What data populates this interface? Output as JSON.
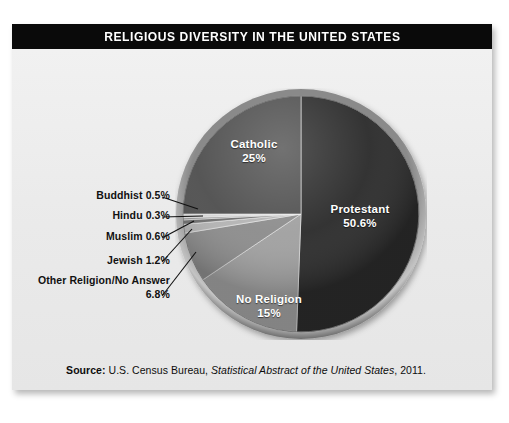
{
  "header": {
    "title": "RELIGIOUS DIVERSITY IN THE UNITED STATES"
  },
  "source": {
    "prefix": "Source:",
    "publisher": " U.S. Census Bureau, ",
    "work": "Statistical Abstract of the United States",
    "year": ", 2011."
  },
  "labels": {
    "catholic": {
      "name": "Catholic",
      "pct": "25%"
    },
    "protestant": {
      "name": "Protestant",
      "pct": "50.6%"
    },
    "no_religion": {
      "name": "No Religion",
      "pct": "15%"
    },
    "buddhist": {
      "text": "Buddhist 0.5%"
    },
    "hindu": {
      "text": "Hindu 0.3%"
    },
    "muslim": {
      "text": "Muslim 0.6%"
    },
    "jewish": {
      "text": "Jewish 1.2%"
    },
    "other_line1": {
      "text": "Other Religion/No Answer"
    },
    "other_line2": {
      "text": "6.8%"
    }
  },
  "colors": {
    "panel_bg": "#ececec",
    "title_bg": "#0a0a0a",
    "title_fg": "#ffffff",
    "protestant": "#2b2b2b",
    "catholic": "#4f4f4f",
    "no_religion": "#a0a0a0",
    "other_religion": "#8c8c8c",
    "jewish": "#b4b4b4",
    "muslim": "#6e6e6e",
    "hindu": "#9a9a9a",
    "buddhist": "#d8d8d8",
    "rim": "#6a6a6a",
    "leader_line": "#111111"
  },
  "chart_data": {
    "type": "pie",
    "title": "RELIGIOUS DIVERSITY IN THE UNITED STATES",
    "unit": "percent",
    "start_angle_deg": 0,
    "direction": "clockwise",
    "legend": "none",
    "labels": [
      "Protestant",
      "No Religion",
      "Other Religion/No Answer",
      "Jewish",
      "Muslim",
      "Hindu",
      "Buddhist",
      "Catholic"
    ],
    "values": [
      50.6,
      15,
      6.8,
      1.2,
      0.6,
      0.3,
      0.5,
      25
    ],
    "slices": [
      {
        "label": "Protestant",
        "value": 50.6,
        "display": "50.6%",
        "color": "#2b2b2b",
        "label_placement": "inside"
      },
      {
        "label": "No Religion",
        "value": 15,
        "display": "15%",
        "color": "#a0a0a0",
        "label_placement": "inside"
      },
      {
        "label": "Other Religion/No Answer",
        "value": 6.8,
        "display": "6.8%",
        "color": "#8c8c8c",
        "label_placement": "callout"
      },
      {
        "label": "Jewish",
        "value": 1.2,
        "display": "1.2%",
        "color": "#b4b4b4",
        "label_placement": "callout"
      },
      {
        "label": "Muslim",
        "value": 0.6,
        "display": "0.6%",
        "color": "#6e6e6e",
        "label_placement": "callout"
      },
      {
        "label": "Hindu",
        "value": 0.3,
        "display": "0.3%",
        "color": "#9a9a9a",
        "label_placement": "callout"
      },
      {
        "label": "Buddhist",
        "value": 0.5,
        "display": "0.5%",
        "color": "#d8d8d8",
        "label_placement": "callout"
      },
      {
        "label": "Catholic",
        "value": 25,
        "display": "25%",
        "color": "#4f4f4f",
        "label_placement": "inside"
      }
    ],
    "total": 100.0,
    "source": "Source: U.S. Census Bureau, Statistical Abstract of the United States, 2011."
  }
}
